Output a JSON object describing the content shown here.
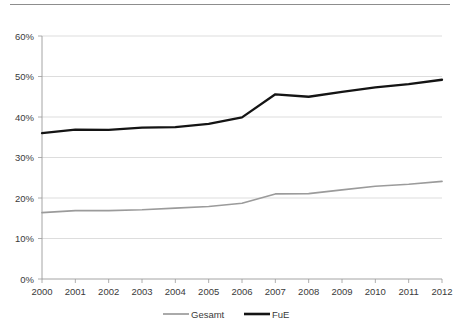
{
  "chart_data": {
    "type": "line",
    "title": "",
    "subtitle": "",
    "xlabel": "",
    "ylabel": "",
    "x": [
      "2000",
      "2001",
      "2002",
      "2003",
      "2004",
      "2005",
      "2006",
      "2007",
      "2008",
      "2009",
      "2010",
      "2011",
      "2012"
    ],
    "categories": [
      "2000",
      "2001",
      "2002",
      "2003",
      "2004",
      "2005",
      "2006",
      "2007",
      "2008",
      "2009",
      "2010",
      "2011",
      "2012"
    ],
    "series": [
      {
        "name": "Gesamt",
        "color": "#9b9b9b",
        "values": [
          16.4,
          16.9,
          16.9,
          17.1,
          17.5,
          17.9,
          18.7,
          21.0,
          21.1,
          22.0,
          22.9,
          23.4,
          24.1
        ]
      },
      {
        "name": "FuE",
        "color": "#141414",
        "values": [
          36.0,
          36.9,
          36.8,
          37.4,
          37.5,
          38.3,
          39.9,
          45.6,
          45.0,
          46.2,
          47.3,
          48.1,
          49.2
        ]
      }
    ],
    "ylim": [
      0,
      60
    ],
    "yticks": [
      0,
      10,
      20,
      30,
      40,
      50,
      60
    ],
    "ytick_labels": [
      "0%",
      "10%",
      "20%",
      "30%",
      "40%",
      "50%",
      "60%"
    ],
    "xtick_labels": [
      "2000",
      "2001",
      "2002",
      "2003",
      "2004",
      "2005",
      "2006",
      "2007",
      "2008",
      "2009",
      "2010",
      "2011",
      "2012"
    ],
    "grid": true,
    "grid_axis": "y",
    "legend": [
      "Gesamt",
      "FuE"
    ],
    "legend_position": "bottom",
    "value_unit": "%"
  },
  "legend": {
    "items": [
      {
        "label": "Gesamt"
      },
      {
        "label": "FuE"
      }
    ]
  },
  "axes": {
    "y": {
      "labels": [
        "60%",
        "50%",
        "40%",
        "30%",
        "20%",
        "10%",
        "0%"
      ]
    },
    "x": {
      "labels": [
        "2000",
        "2001",
        "2002",
        "2003",
        "2004",
        "2005",
        "2006",
        "2007",
        "2008",
        "2009",
        "2010",
        "2011",
        "2012"
      ]
    }
  }
}
